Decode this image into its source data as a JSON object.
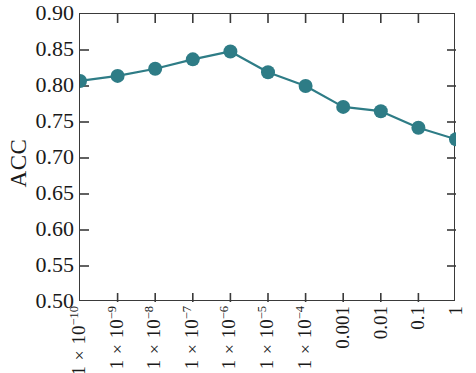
{
  "chart_data": {
    "type": "line",
    "title": "",
    "subtitle": "",
    "xlabel": "",
    "ylabel": "ACC",
    "categories": [
      "1 × 10⁻¹⁰",
      "1 × 10⁻⁹",
      "1 × 10⁻⁸",
      "1 × 10⁻⁷",
      "1 × 10⁻⁶",
      "1 × 10⁻⁵",
      "1 × 10⁻⁴",
      "0.001",
      "0.01",
      "0.1",
      "1"
    ],
    "values": [
      0.807,
      0.814,
      0.824,
      0.837,
      0.848,
      0.819,
      0.8,
      0.771,
      0.765,
      0.742,
      0.726
    ],
    "series": [
      {
        "name": "ACC",
        "values": [
          0.807,
          0.814,
          0.824,
          0.837,
          0.848,
          0.819,
          0.8,
          0.771,
          0.765,
          0.742,
          0.726
        ],
        "color": "#2E7C86"
      }
    ],
    "ylim": [
      0.5,
      0.9
    ],
    "yticks": [
      0.5,
      0.55,
      0.6,
      0.65,
      0.7,
      0.75,
      0.8,
      0.85,
      0.9
    ],
    "ytick_labels": [
      "0.50",
      "0.55",
      "0.60",
      "0.65",
      "0.70",
      "0.75",
      "0.80",
      "0.85",
      "0.90"
    ],
    "grid": false,
    "legend": "none",
    "marker": "circle",
    "line_color": "#2E7C86",
    "marker_color": "#2E7C86",
    "axis_color": "#3a3a3a"
  },
  "xtick_parts": [
    {
      "base": "1 × 10",
      "exp": "−10"
    },
    {
      "base": "1 × 10",
      "exp": "−9"
    },
    {
      "base": "1 × 10",
      "exp": "−8"
    },
    {
      "base": "1 × 10",
      "exp": "−7"
    },
    {
      "base": "1 × 10",
      "exp": "−6"
    },
    {
      "base": "1 × 10",
      "exp": "−5"
    },
    {
      "base": "1 × 10",
      "exp": "−4"
    },
    {
      "base": "0.001",
      "exp": ""
    },
    {
      "base": "0.01",
      "exp": ""
    },
    {
      "base": "0.1",
      "exp": ""
    },
    {
      "base": "1",
      "exp": ""
    }
  ]
}
